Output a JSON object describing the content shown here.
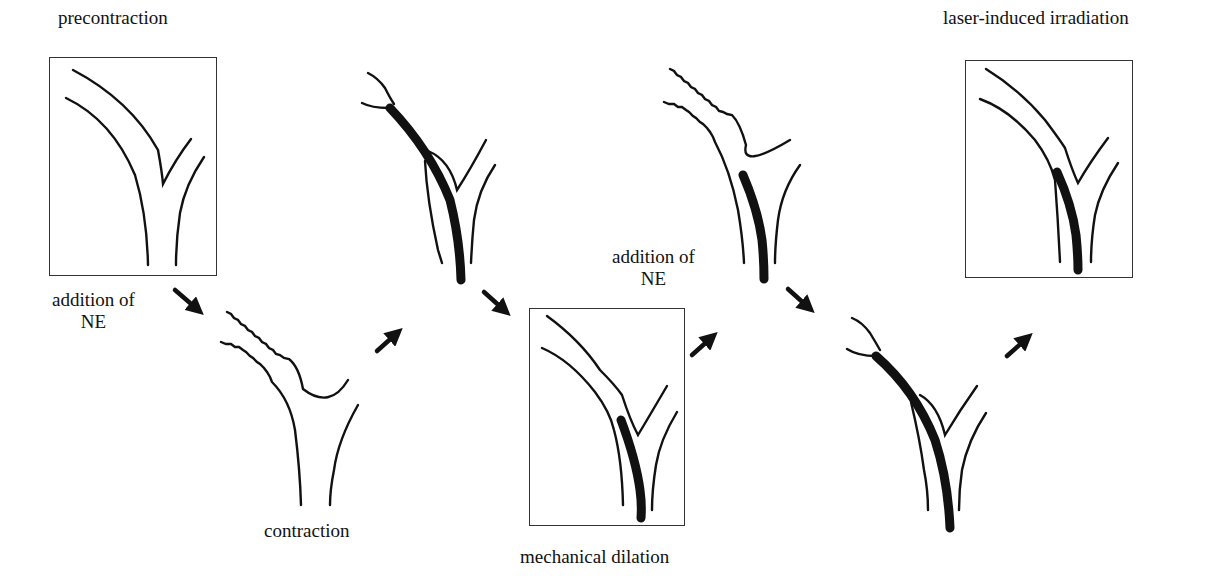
{
  "diagram": {
    "labels": {
      "precontraction": "precontraction",
      "addition_ne_1_line1": "addition of",
      "addition_ne_1_line2": "NE",
      "contraction": "contraction",
      "mechanical_dilation": "mechanical dilation",
      "addition_ne_2_line1": "addition of",
      "addition_ne_2_line2": "NE",
      "laser_irradiation": "laser-induced irradiation"
    },
    "stages": [
      {
        "id": "precontraction",
        "boxed": true,
        "vessel": "relaxed",
        "balloon": "none"
      },
      {
        "id": "contraction",
        "boxed": false,
        "vessel": "contracted",
        "balloon": "none"
      },
      {
        "id": "balloon-inflated-1",
        "boxed": false,
        "vessel": "contracted",
        "balloon": "full-length"
      },
      {
        "id": "mechanical-dilation",
        "boxed": true,
        "vessel": "dilated",
        "balloon": "distal"
      },
      {
        "id": "contraction-with-balloon",
        "boxed": false,
        "vessel": "contracted",
        "balloon": "distal"
      },
      {
        "id": "balloon-inflated-2",
        "boxed": false,
        "vessel": "contracted",
        "balloon": "full-length"
      },
      {
        "id": "laser-induced-irradiation",
        "boxed": true,
        "vessel": "dilated",
        "balloon": "distal"
      }
    ],
    "arrows": [
      {
        "direction": "down-right",
        "from": "precontraction",
        "to": "contraction"
      },
      {
        "direction": "up-right",
        "from": "contraction",
        "to": "balloon-inflated-1"
      },
      {
        "direction": "down-right",
        "from": "balloon-inflated-1",
        "to": "mechanical-dilation"
      },
      {
        "direction": "up-right",
        "from": "mechanical-dilation",
        "to": "contraction-with-balloon"
      },
      {
        "direction": "down-right",
        "from": "contraction-with-balloon",
        "to": "balloon-inflated-2"
      },
      {
        "direction": "up-right",
        "from": "balloon-inflated-2",
        "to": "laser-induced-irradiation"
      }
    ],
    "colors": {
      "ink": "#111111",
      "background": "#ffffff",
      "frame": "#333333"
    }
  }
}
